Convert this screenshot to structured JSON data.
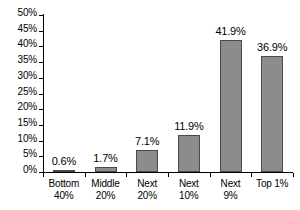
{
  "chart_data": {
    "type": "bar",
    "title": "",
    "subtitle": "",
    "xlabel": "",
    "ylabel": "",
    "categories": [
      "Bottom 40%",
      "Middle 20%",
      "Next 20%",
      "Next 10%",
      "Next 9%",
      "Top 1%"
    ],
    "category_lines": [
      {
        "line1": "Bottom",
        "line2": "40%"
      },
      {
        "line1": "Middle",
        "line2": "20%"
      },
      {
        "line1": "Next",
        "line2": "20%"
      },
      {
        "line1": "Next",
        "line2": "10%"
      },
      {
        "line1": "Next",
        "line2": "9%"
      },
      {
        "line1": "Top 1%",
        "line2": ""
      }
    ],
    "values": [
      0.6,
      1.7,
      7.1,
      11.9,
      41.9,
      36.9
    ],
    "data_labels": [
      "0.6%",
      "1.7%",
      "7.1%",
      "11.9%",
      "41.9%",
      "36.9%"
    ],
    "ylim": [
      0,
      50
    ],
    "ytick_step": 5,
    "ytick_labels": [
      "50%",
      "45%",
      "40%",
      "35%",
      "30%",
      "25%",
      "20%",
      "15%",
      "10%",
      "5%",
      "0%"
    ],
    "ytick_values": [
      50,
      45,
      40,
      35,
      30,
      25,
      20,
      15,
      10,
      5,
      0
    ],
    "grid": false,
    "legend": false,
    "legend_position": "none",
    "bar_color": "#8c8c8c",
    "bar_border_color": "#4a4a4a",
    "axis_color": "#000000",
    "background_color": "#ffffff"
  }
}
